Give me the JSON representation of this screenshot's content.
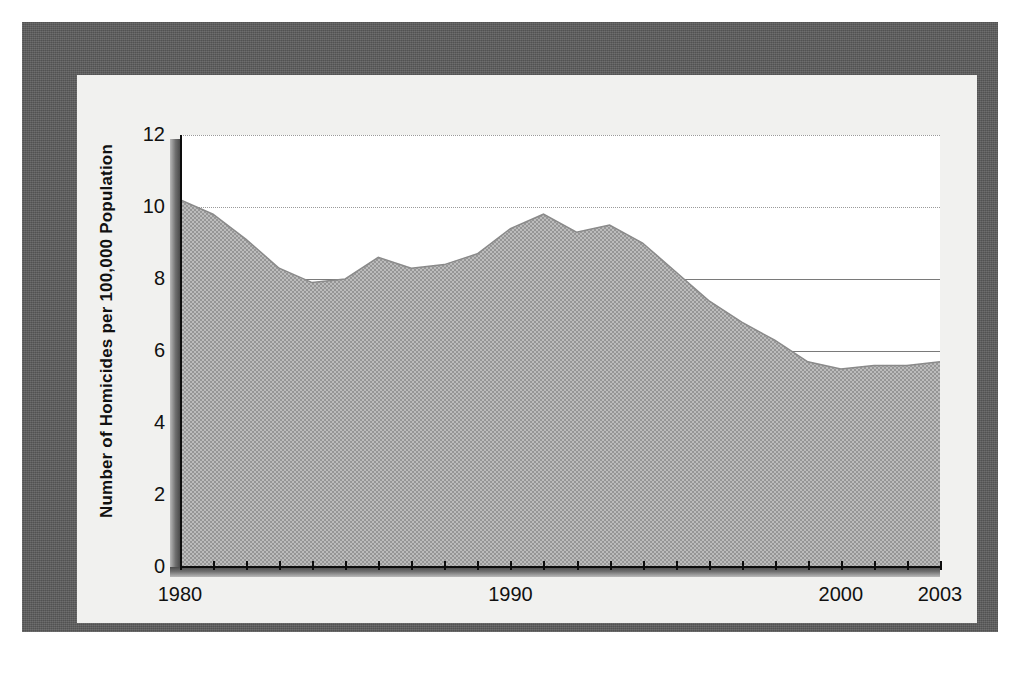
{
  "figure": {
    "frame_color": "#595959",
    "panel_color": "#f1f1ef",
    "plot_background": "#ffffff"
  },
  "chart_data": {
    "type": "area",
    "title": "",
    "subtitle": "",
    "xlabel": "",
    "ylabel": "Number of Homicides per 100,000 Population",
    "series_name": "Homicide rate",
    "fill_color": "#a8a8a8",
    "line_color": "#8f8f8f",
    "grid": true,
    "grid_style": "horizontal",
    "legend": "none",
    "xlim": [
      1980,
      2003
    ],
    "ylim": [
      0,
      12
    ],
    "yticks": [
      0,
      2,
      4,
      6,
      8,
      10,
      12
    ],
    "ytick_labels": [
      "0",
      "2",
      "4",
      "6",
      "8",
      "10",
      "12"
    ],
    "xticks": [
      1980,
      1981,
      1982,
      1983,
      1984,
      1985,
      1986,
      1987,
      1988,
      1989,
      1990,
      1991,
      1992,
      1993,
      1994,
      1995,
      1996,
      1997,
      1998,
      1999,
      2000,
      2001,
      2002,
      2003
    ],
    "xtick_labels_shown": [
      "1980",
      "1990",
      "2000",
      "2003"
    ],
    "xtick_label_positions": [
      1980,
      1990,
      2000,
      2003
    ],
    "x": [
      1980,
      1981,
      1982,
      1983,
      1984,
      1985,
      1986,
      1987,
      1988,
      1989,
      1990,
      1991,
      1992,
      1993,
      1994,
      1995,
      1996,
      1997,
      1998,
      1999,
      2000,
      2001,
      2002,
      2003
    ],
    "values": [
      10.2,
      9.8,
      9.1,
      8.3,
      7.9,
      8.0,
      8.6,
      8.3,
      8.4,
      8.7,
      9.4,
      9.8,
      9.3,
      9.5,
      9.0,
      8.2,
      7.4,
      6.8,
      6.3,
      5.7,
      5.5,
      5.6,
      5.6,
      5.7
    ],
    "annotations": []
  }
}
